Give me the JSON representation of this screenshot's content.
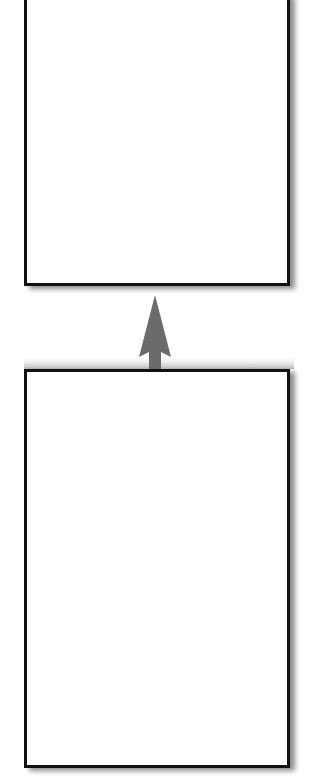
{
  "diagram": {
    "nodes": [
      {
        "id": "top-box",
        "label": ""
      },
      {
        "id": "bottom-box",
        "label": ""
      }
    ],
    "edges": [
      {
        "from": "bottom-box",
        "to": "top-box",
        "direction": "up",
        "label": ""
      }
    ],
    "colors": {
      "border": "#111111",
      "arrow": "#6b6b6b",
      "background": "#ffffff"
    }
  }
}
